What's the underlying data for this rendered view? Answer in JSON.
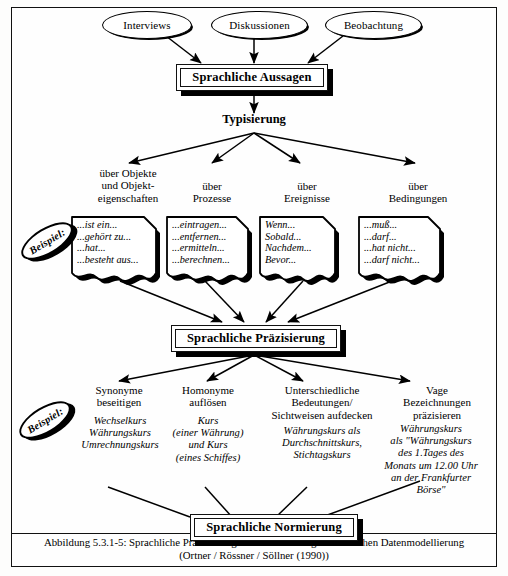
{
  "figure": {
    "sources": [
      {
        "label": "Interviews"
      },
      {
        "label": "Diskussionen"
      },
      {
        "label": "Beobachtung"
      }
    ],
    "process_boxes": [
      {
        "label": "Sprachliche Aussagen"
      },
      {
        "label": "Sprachliche Präzisierung"
      },
      {
        "label": "Sprachliche Normierung"
      }
    ],
    "stage_typisierung": "Typisierung",
    "typisierung_categories": [
      {
        "lines": [
          "über Objekte",
          "und Objekt-",
          "eigenschaften"
        ]
      },
      {
        "lines": [
          "über",
          "Prozesse"
        ]
      },
      {
        "lines": [
          "über",
          "Ereignisse"
        ]
      },
      {
        "lines": [
          "über",
          "Bedingungen"
        ]
      }
    ],
    "typisierung_examples": [
      {
        "lines": [
          "...ist ein...",
          "...gehört zu...",
          "...hat...",
          "...besteht aus..."
        ]
      },
      {
        "lines": [
          "...eintragen...",
          "...entfernen...",
          "...ermitteln...",
          "...berechnen..."
        ]
      },
      {
        "lines": [
          "Wenn...",
          "Sobald...",
          "Nachdem...",
          "Bevor..."
        ]
      },
      {
        "lines": [
          "...muß...",
          "...darf...",
          "...hat nicht...",
          "...darf nicht..."
        ]
      }
    ],
    "praezisierung_categories": [
      {
        "lines": [
          "Synonyme",
          "beseitigen"
        ]
      },
      {
        "lines": [
          "Homonyme",
          "auflösen"
        ]
      },
      {
        "lines": [
          "Unterschiedliche",
          "Bedeutungen/",
          "Sichtweisen aufdecken"
        ]
      },
      {
        "lines": [
          "Vage",
          "Bezeichnungen",
          "präzisieren"
        ]
      }
    ],
    "praezisierung_examples": [
      {
        "lines": [
          "Wechselkurs",
          "Währungskurs",
          "Umrechnungskurs"
        ]
      },
      {
        "lines": [
          "Kurs",
          "(einer Währung)",
          "und Kurs",
          "(eines Schiffes)"
        ]
      },
      {
        "lines": [
          "Währungskurs als",
          "Durchschnittskurs,",
          "Stichtagskurs"
        ]
      },
      {
        "lines": [
          "Währungskurs",
          "als \"Währungskurs",
          "des 1.Tages des",
          "Monats um 12.00 Uhr",
          "an der Frankfurter",
          "Börse\""
        ]
      }
    ],
    "beispiel_badges": [
      {
        "label": "Beispiel:"
      },
      {
        "label": "Beispiel:"
      }
    ],
    "caption": {
      "line1": "Abbildung 5.3.1-5: Sprachliche Präzisierung als Schritt der organisatorischen Datenmodellierung",
      "line2": "(Ortner / Rössner / Söllner (1990))"
    },
    "colors": {
      "ink": "#000000",
      "paper": "#ffffff",
      "frame": "#111111"
    }
  }
}
